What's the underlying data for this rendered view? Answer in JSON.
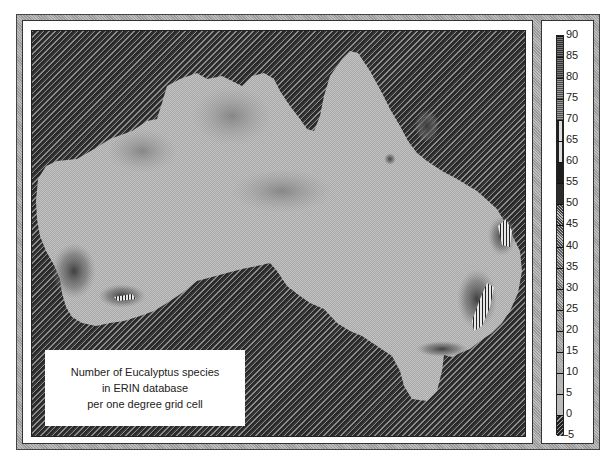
{
  "caption": {
    "line1": "Number of Eucalyptus species",
    "line2": "in ERIN database",
    "line3": "per one degree grid cell"
  },
  "legend": {
    "labels": [
      "90",
      "85",
      "80",
      "75",
      "70",
      "65",
      "60",
      "55",
      "50",
      "45",
      "40",
      "35",
      "30",
      "25",
      "20",
      "15",
      "10",
      "5",
      "0",
      "-5"
    ],
    "min": -5,
    "max": 90,
    "step": 5,
    "bands": [
      {
        "from": 85,
        "to": 90,
        "color": "#2e2e2e",
        "pattern": "dots"
      },
      {
        "from": 80,
        "to": 85,
        "color": "#3a3a3a",
        "pattern": "dots"
      },
      {
        "from": 75,
        "to": 80,
        "color": "#4a4a4a",
        "pattern": "grid"
      },
      {
        "from": 70,
        "to": 75,
        "color": "#4f4f4f",
        "pattern": "grid"
      },
      {
        "from": 65,
        "to": 70,
        "color": "#dcdcdc",
        "pattern": "vstripe"
      },
      {
        "from": 60,
        "to": 65,
        "color": "#dcdcdc",
        "pattern": "vstripe"
      },
      {
        "from": 55,
        "to": 60,
        "color": "#1e1e1e",
        "pattern": "solid"
      },
      {
        "from": 50,
        "to": 55,
        "color": "#2c2c2c",
        "pattern": "solid"
      },
      {
        "from": 45,
        "to": 50,
        "color": "#3c3c3c",
        "pattern": "checker"
      },
      {
        "from": 40,
        "to": 45,
        "color": "#4c4c4c",
        "pattern": "checker"
      },
      {
        "from": 35,
        "to": 40,
        "color": "#5e5e5e",
        "pattern": "checker"
      },
      {
        "from": 30,
        "to": 35,
        "color": "#6e6e6e",
        "pattern": "checker"
      },
      {
        "from": 25,
        "to": 30,
        "color": "#7a7a7a",
        "pattern": "checker"
      },
      {
        "from": 20,
        "to": 25,
        "color": "#888888",
        "pattern": "checker"
      },
      {
        "from": 15,
        "to": 20,
        "color": "#959595",
        "pattern": "checker"
      },
      {
        "from": 10,
        "to": 15,
        "color": "#a2a2a2",
        "pattern": "checker"
      },
      {
        "from": 5,
        "to": 10,
        "color": "#aeaeae",
        "pattern": "checker"
      },
      {
        "from": 0,
        "to": 5,
        "color": "#bababa",
        "pattern": "checker"
      },
      {
        "from": -5,
        "to": 0,
        "color": "#333333",
        "pattern": "hatch"
      }
    ]
  },
  "map": {
    "subject": "Australia",
    "hotspots": [
      {
        "name": "south-west-wa",
        "level": 40
      },
      {
        "name": "albany-region",
        "level": 55
      },
      {
        "name": "cape-york",
        "level": 45
      },
      {
        "name": "north-queensland-spot",
        "level": 50
      },
      {
        "name": "south-east-queensland",
        "level": 65
      },
      {
        "name": "new-south-wales-central",
        "level": 70
      },
      {
        "name": "victoria-highlands",
        "level": 40
      }
    ],
    "ocean_level": -5
  }
}
